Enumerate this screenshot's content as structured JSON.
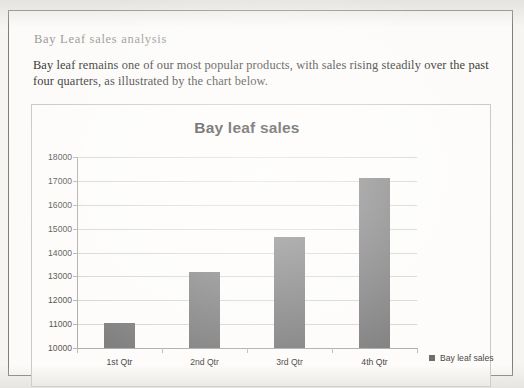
{
  "document": {
    "title": "Bay Leaf sales analysis",
    "paragraph": "Bay leaf remains one of our most popular products, with sales rising steadily over the past four quarters, as illustrated by the chart below."
  },
  "chart_data": {
    "type": "bar",
    "title": "Bay leaf sales",
    "categories": [
      "1st Qtr",
      "2nd Qtr",
      "3rd Qtr",
      "4th Qtr"
    ],
    "values": [
      11050,
      13200,
      14650,
      17100
    ],
    "series": [
      {
        "name": "Bay leaf sales",
        "values": [
          11050,
          13200,
          14650,
          17100
        ]
      }
    ],
    "legend": [
      "Bay leaf sales"
    ],
    "legend_position": "right",
    "xlabel": "",
    "ylabel": "",
    "ylim": [
      10000,
      18000
    ],
    "ytick_labels": [
      "10000",
      "11000",
      "12000",
      "13000",
      "14000",
      "15000",
      "16000",
      "17000",
      "18000"
    ],
    "ytick_values": [
      10000,
      11000,
      12000,
      13000,
      14000,
      15000,
      16000,
      17000,
      18000
    ],
    "grid": true,
    "bar_color": "#808080",
    "gridline_color": "#d8d6d2",
    "axis_color": "#b0aeaa"
  }
}
